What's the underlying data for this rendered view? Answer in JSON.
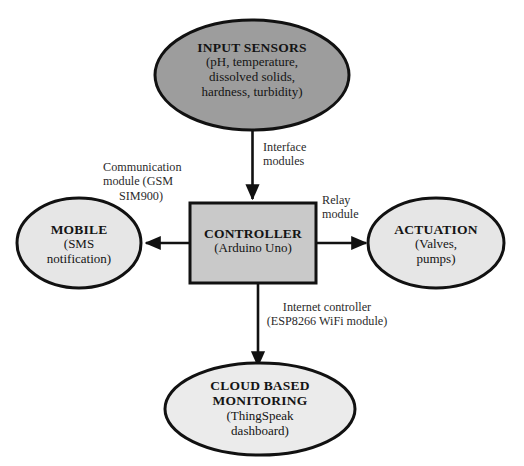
{
  "diagram": {
    "type": "block-diagram",
    "background_color": "#ffffff",
    "stroke_color": "#111111",
    "nodes": [
      {
        "id": "input-sensors",
        "shape": "ellipse",
        "fill": "#9d9d9d",
        "title": "INPUT SENSORS",
        "sub_lines": [
          "(pH, temperature,",
          "dissolved solids,",
          "hardness, turbidity)"
        ]
      },
      {
        "id": "controller",
        "shape": "rectangle",
        "fill": "#c9c9c9",
        "title": "CONTROLLER",
        "sub_lines": [
          "(Arduino Uno)"
        ]
      },
      {
        "id": "mobile",
        "shape": "ellipse",
        "fill": "#e6e6e6",
        "title": "MOBILE",
        "sub_lines": [
          "(SMS",
          "notification)"
        ]
      },
      {
        "id": "actuation",
        "shape": "ellipse",
        "fill": "#e6e6e6",
        "title": "ACTUATION",
        "sub_lines": [
          "(Valves,",
          "pumps)"
        ]
      },
      {
        "id": "cloud-monitoring",
        "shape": "ellipse",
        "fill": "#ebebeb",
        "title_lines": [
          "CLOUD BASED",
          "MONITORING"
        ],
        "sub_lines": [
          "(ThingSpeak",
          "dashboard)"
        ]
      }
    ],
    "edges": [
      {
        "id": "sensors-to-controller",
        "from": "input-sensors",
        "to": "controller",
        "direction": "down",
        "label_lines": [
          "Interface",
          "modules"
        ]
      },
      {
        "id": "controller-to-mobile",
        "from": "controller",
        "to": "mobile",
        "direction": "left",
        "label_lines": [
          "Communication",
          "module (GSM",
          "SIM900)"
        ]
      },
      {
        "id": "controller-to-actuation",
        "from": "controller",
        "to": "actuation",
        "direction": "right",
        "label_lines": [
          "Relay",
          "module"
        ]
      },
      {
        "id": "controller-to-cloud",
        "from": "controller",
        "to": "cloud-monitoring",
        "direction": "down",
        "label_lines": [
          "Internet controller",
          "(ESP8266 WiFi module)"
        ]
      }
    ]
  }
}
